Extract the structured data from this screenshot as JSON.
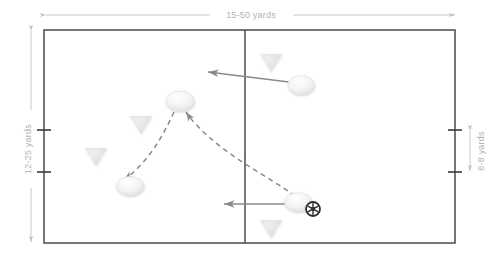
{
  "diagram": {
    "type": "sports-field-drill",
    "dimensions": {
      "width_label": "15-50 yards",
      "height_label": "12-25 yards",
      "goal_label": "6-8 yards"
    },
    "colors": {
      "field_border": "#4a4a4a",
      "midline": "#4a4a4a",
      "dimension_line": "#c9c9c9",
      "dimension_text": "#b4b4b4",
      "cone": "#e2e2e2",
      "player": "#f0f0f0",
      "player_edge": "#dcdcdc",
      "movement_arrow": "#8a8a8a",
      "pass_arrow": "#8a8a8a",
      "ball": "#3a3a3a"
    },
    "field": {
      "x": 44,
      "y": 30,
      "width": 411,
      "height": 213,
      "midline_x": 245
    },
    "cones": [
      {
        "id": "cone-top-right",
        "cx": 271,
        "cy": 62
      },
      {
        "id": "cone-mid-left",
        "cx": 141,
        "cy": 124
      },
      {
        "id": "cone-lower-left",
        "cx": 96,
        "cy": 156
      },
      {
        "id": "cone-bottom-right",
        "cx": 271,
        "cy": 228
      }
    ],
    "players": [
      {
        "id": "player-top-right",
        "cx": 301,
        "cy": 85,
        "has_ball": false
      },
      {
        "id": "player-center-top",
        "cx": 180,
        "cy": 101,
        "has_ball": false
      },
      {
        "id": "player-lower-left",
        "cx": 130,
        "cy": 186,
        "has_ball": false
      },
      {
        "id": "player-with-ball",
        "cx": 297,
        "cy": 203,
        "has_ball": true
      }
    ],
    "ball": {
      "id": "soccer-ball",
      "cx": 313,
      "cy": 209,
      "r": 7
    },
    "movement_arrows": [
      {
        "id": "run-upper",
        "x1": 288,
        "y1": 82,
        "x2": 208,
        "y2": 72
      },
      {
        "id": "run-lower",
        "x1": 286,
        "y1": 204,
        "x2": 224,
        "y2": 204
      }
    ],
    "pass_arrows": [
      {
        "id": "pass-to-center",
        "from": "player-with-ball",
        "to": "player-center-top"
      },
      {
        "id": "pass-to-lower-left",
        "from": "player-center-top",
        "to": "player-lower-left"
      }
    ],
    "goal_ticks": [
      {
        "id": "tick-left-top",
        "x": 44,
        "y": 130
      },
      {
        "id": "tick-left-bottom",
        "x": 44,
        "y": 172
      },
      {
        "id": "tick-right-top",
        "x": 455,
        "y": 130
      },
      {
        "id": "tick-right-bottom",
        "x": 455,
        "y": 172
      }
    ]
  }
}
